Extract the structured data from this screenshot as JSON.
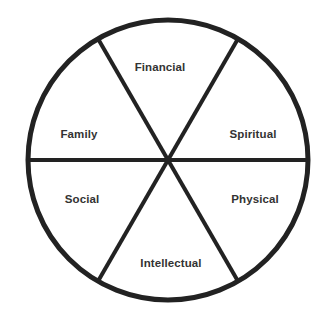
{
  "diagram": {
    "type": "pie-wheel",
    "title_visible": false,
    "background_color": "#ffffff",
    "stroke_color": "#222222",
    "label_color": "#333333",
    "circle": {
      "center_x": 168,
      "center_y": 160,
      "radius": 140,
      "stroke_width": 5
    },
    "divider_stroke_width": 4,
    "divider_count": 3,
    "sector_count": 6,
    "sector_angle_degrees": 60,
    "sectors": [
      {
        "label": "Financial",
        "position": "top",
        "label_x": 160,
        "label_y": 68,
        "start_angle": -120,
        "end_angle": -60
      },
      {
        "label": "Spiritual",
        "position": "upper-right",
        "label_x": 253,
        "label_y": 135,
        "start_angle": -60,
        "end_angle": 0
      },
      {
        "label": "Physical",
        "position": "lower-right",
        "label_x": 255,
        "label_y": 200,
        "start_angle": 0,
        "end_angle": 60
      },
      {
        "label": "Intellectual",
        "position": "bottom",
        "label_x": 171,
        "label_y": 264,
        "start_angle": 60,
        "end_angle": 120
      },
      {
        "label": "Social",
        "position": "lower-left",
        "label_x": 82,
        "label_y": 200,
        "start_angle": 120,
        "end_angle": 180
      },
      {
        "label": "Family",
        "position": "upper-left",
        "label_x": 79,
        "label_y": 135,
        "start_angle": 180,
        "end_angle": 240
      }
    ]
  }
}
